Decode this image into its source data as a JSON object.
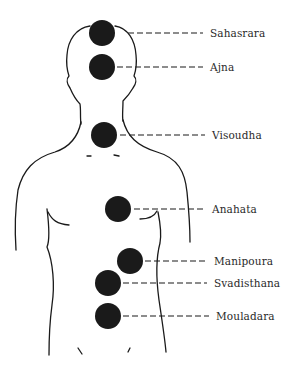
{
  "diagram": {
    "title": "",
    "colors": {
      "ink": "#1a1a1a",
      "background": "#ffffff",
      "label": "#2a2a2a"
    },
    "chakras": [
      {
        "id": "sahasrara",
        "label": "Sahasrara",
        "cx": 102,
        "cy": 33,
        "r": 13,
        "line_x1": 128,
        "line_x2": 203,
        "label_x": 210
      },
      {
        "id": "ajna",
        "label": "Ajna",
        "cx": 102,
        "cy": 67,
        "r": 13,
        "line_x1": 117,
        "line_x2": 203,
        "label_x": 210
      },
      {
        "id": "visoudha",
        "label": "Visoudha",
        "cx": 104,
        "cy": 135,
        "r": 13,
        "line_x1": 120,
        "line_x2": 205,
        "label_x": 212
      },
      {
        "id": "anahata",
        "label": "Anahata",
        "cx": 118,
        "cy": 209,
        "r": 13,
        "line_x1": 134,
        "line_x2": 205,
        "label_x": 212
      },
      {
        "id": "manipoura",
        "label": "Manipoura",
        "cx": 130,
        "cy": 261,
        "r": 13,
        "line_x1": 145,
        "line_x2": 207,
        "label_x": 214
      },
      {
        "id": "svadisthana",
        "label": "Svadisthana",
        "cx": 108,
        "cy": 283,
        "r": 13,
        "line_x1": 123,
        "line_x2": 207,
        "label_x": 214
      },
      {
        "id": "mouladara",
        "label": "Mouladara",
        "cx": 108,
        "cy": 316,
        "r": 13,
        "line_x1": 123,
        "line_x2": 209,
        "label_x": 216
      }
    ]
  }
}
